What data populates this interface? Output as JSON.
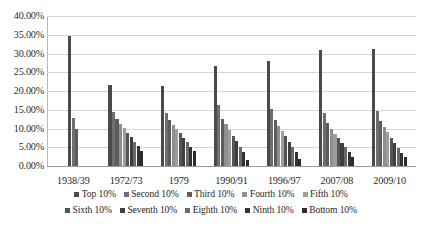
{
  "chart_data": {
    "type": "bar",
    "title": "",
    "subtitle": "",
    "xlabel": "",
    "ylabel": "",
    "ylim": [
      0,
      40
    ],
    "ytick_step": 5,
    "ytick_labels": [
      "0.00%",
      "5.00%",
      "10.00%",
      "15.00%",
      "20.00%",
      "25.00%",
      "30.00%",
      "35.00%",
      "40.00%"
    ],
    "ytick_values": [
      0,
      5,
      10,
      15,
      20,
      25,
      30,
      35,
      40
    ],
    "grid": true,
    "grid_axis": "y",
    "legend_position": "bottom",
    "categories": [
      "1938/39",
      "1972/73",
      "1979",
      "1990/91",
      "1996/97",
      "2007/08",
      "2009/10"
    ],
    "series": [
      {
        "name": "Top 10%",
        "color": "#4a4a4a",
        "values": [
          34.6,
          21.6,
          21.3,
          26.8,
          28.0,
          31.0,
          31.1
        ]
      },
      {
        "name": "Second 10%",
        "color": "#6e6e6e",
        "values": [
          12.7,
          14.5,
          14.2,
          16.2,
          15.3,
          14.2,
          14.6
        ]
      },
      {
        "name": "Third 10%",
        "color": "#5c5c5c",
        "values": [
          10.0,
          12.6,
          12.4,
          12.6,
          12.3,
          11.5,
          12.0
        ]
      },
      {
        "name": "Fourth 10%",
        "color": "#8f8f8f",
        "values": [
          null,
          11.3,
          11.0,
          11.2,
          10.7,
          9.9,
          10.5
        ]
      },
      {
        "name": "Fifth 10%",
        "color": "#9d9d9d",
        "values": [
          null,
          10.1,
          10.0,
          9.6,
          9.3,
          8.6,
          9.0
        ]
      },
      {
        "name": "Sixth 10%",
        "color": "#545454",
        "values": [
          null,
          8.8,
          8.7,
          8.1,
          7.9,
          7.4,
          7.6
        ]
      },
      {
        "name": "Seventh 10%",
        "color": "#3f3f3f",
        "values": [
          null,
          7.7,
          7.5,
          6.6,
          6.5,
          6.2,
          6.2
        ]
      },
      {
        "name": "Eighth 10%",
        "color": "#6a6a6a",
        "values": [
          null,
          6.5,
          6.4,
          5.2,
          5.2,
          5.0,
          4.9
        ]
      },
      {
        "name": "Ninth 10%",
        "color": "#333333",
        "values": [
          null,
          5.3,
          5.2,
          3.7,
          3.7,
          3.8,
          3.5
        ]
      },
      {
        "name": "Bottom 10%",
        "color": "#2b2b2b",
        "values": [
          null,
          4.1,
          4.0,
          1.7,
          1.8,
          2.3,
          2.4
        ]
      }
    ]
  },
  "legend": {
    "rows": [
      [
        "Top 10%",
        "Second 10%",
        "Third 10%",
        "Fourth 10%",
        "Fifth 10%"
      ],
      [
        "Sixth 10%",
        "Seventh 10%",
        "Eighth 10%",
        "Ninth 10%",
        "Bottom 10%"
      ]
    ]
  }
}
